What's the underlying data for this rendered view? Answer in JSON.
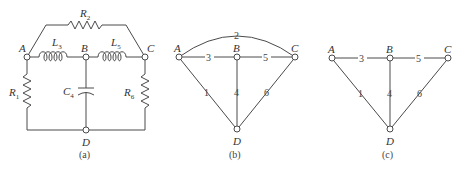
{
  "figure": {
    "panels": [
      {
        "id": "a",
        "caption": "(a)",
        "type": "circuit",
        "nodes": [
          "A",
          "B",
          "C",
          "D"
        ],
        "components": [
          {
            "name": "R",
            "sub": "1",
            "kind": "resistor",
            "from": "A",
            "to": "D"
          },
          {
            "name": "R",
            "sub": "2",
            "kind": "resistor",
            "from": "A",
            "to": "C"
          },
          {
            "name": "L",
            "sub": "3",
            "kind": "inductor",
            "from": "A",
            "to": "B"
          },
          {
            "name": "C",
            "sub": "4",
            "kind": "capacitor",
            "from": "B",
            "to": "D"
          },
          {
            "name": "L",
            "sub": "5",
            "kind": "inductor",
            "from": "B",
            "to": "C"
          },
          {
            "name": "R",
            "sub": "6",
            "kind": "resistor",
            "from": "C",
            "to": "D"
          }
        ]
      },
      {
        "id": "b",
        "caption": "(b)",
        "type": "graph",
        "nodes": [
          "A",
          "B",
          "C",
          "D"
        ],
        "edges": [
          {
            "label": "1",
            "from": "A",
            "to": "D"
          },
          {
            "label": "2",
            "from": "A",
            "to": "C"
          },
          {
            "label": "3",
            "from": "A",
            "to": "B"
          },
          {
            "label": "4",
            "from": "B",
            "to": "D"
          },
          {
            "label": "5",
            "from": "B",
            "to": "C"
          },
          {
            "label": "6",
            "from": "C",
            "to": "D"
          }
        ]
      },
      {
        "id": "c",
        "caption": "(c)",
        "type": "graph",
        "nodes": [
          "A",
          "B",
          "C",
          "D"
        ],
        "edges": [
          {
            "label": "1",
            "from": "A",
            "to": "D"
          },
          {
            "label": "3",
            "from": "A",
            "to": "B"
          },
          {
            "label": "4",
            "from": "B",
            "to": "D"
          },
          {
            "label": "5",
            "from": "B",
            "to": "C"
          },
          {
            "label": "6",
            "from": "C",
            "to": "D"
          }
        ]
      }
    ]
  }
}
